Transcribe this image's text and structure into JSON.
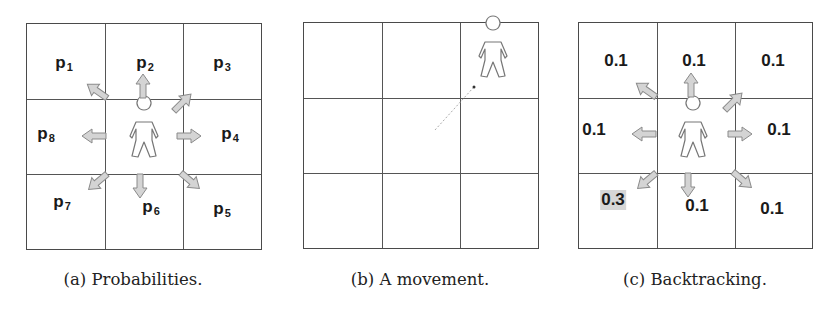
{
  "figure": {
    "panels": [
      {
        "id": "a",
        "caption": "(a) Probabilities.",
        "description": "3x3 grid with person in center and eight arrows pointing to neighbouring cells",
        "cells": [
          {
            "pos": "top-left",
            "label": "p",
            "sub": "1"
          },
          {
            "pos": "top-center",
            "label": "p",
            "sub": "2"
          },
          {
            "pos": "top-right",
            "label": "p",
            "sub": "3"
          },
          {
            "pos": "middle-right",
            "label": "p",
            "sub": "4"
          },
          {
            "pos": "bottom-right",
            "label": "p",
            "sub": "5"
          },
          {
            "pos": "bottom-center",
            "label": "p",
            "sub": "6"
          },
          {
            "pos": "bottom-left",
            "label": "p",
            "sub": "7"
          },
          {
            "pos": "middle-left",
            "label": "p",
            "sub": "8"
          }
        ],
        "person_cell": "middle-center"
      },
      {
        "id": "b",
        "caption": "(b) A movement.",
        "description": "3x3 grid with person moved to top-right cell, dotted trail from center",
        "person_cell": "top-right",
        "trail_from": "middle-center"
      },
      {
        "id": "c",
        "caption": "(c) Backtracking.",
        "description": "3x3 grid with probabilities; backtracking cell highlighted",
        "cells": [
          {
            "pos": "top-left",
            "value": "0.1"
          },
          {
            "pos": "top-center",
            "value": "0.1"
          },
          {
            "pos": "top-right",
            "value": "0.1"
          },
          {
            "pos": "middle-right",
            "value": "0.1"
          },
          {
            "pos": "bottom-right",
            "value": "0.1"
          },
          {
            "pos": "bottom-center",
            "value": "0.1"
          },
          {
            "pos": "bottom-left",
            "value": "0.3",
            "highlighted": true
          },
          {
            "pos": "middle-left",
            "value": "0.1"
          }
        ],
        "person_cell": "middle-center"
      }
    ],
    "colors": {
      "grid_line": "#4a4a4a",
      "arrow_fill": "#d4d4d4",
      "arrow_stroke": "#8a8a8a",
      "highlight": "#d6d6d6",
      "text": "#1a1a1a"
    }
  }
}
